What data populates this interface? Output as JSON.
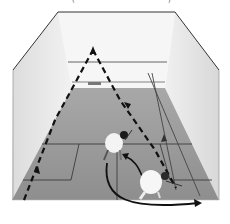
{
  "image": {
    "subject": "Squash court viewed from behind, two players with shot trajectory arrows",
    "palette": {
      "wall_light": "#f4f4f4",
      "wall_side": "#e2e2e2",
      "floor": "#9a9a9a",
      "floor_dark": "#8a8a8a",
      "line": "#444444",
      "arrow": "#111111",
      "player_shirt": "#f2f2f2",
      "player_hair": "#1a1a1a"
    },
    "top_fragments": [
      "(",
      ")"
    ],
    "elements": [
      "front-wall",
      "side-walls",
      "floor",
      "service-box-left",
      "service-box-right",
      "short-line",
      "half-court-line",
      "dashed-trajectory",
      "curved-movement-arrow",
      "player-near",
      "player-far"
    ]
  }
}
